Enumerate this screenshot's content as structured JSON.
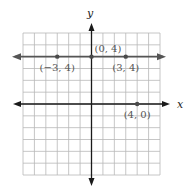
{
  "chart_data": {
    "type": "line",
    "title": "",
    "xlabel": "x",
    "ylabel": "y",
    "xlim": [
      -6,
      6
    ],
    "ylim": [
      -6,
      6
    ],
    "grid": true,
    "series": [
      {
        "name": "horizontal line y = 4",
        "x": [
          -6,
          6
        ],
        "y": [
          4,
          4
        ],
        "arrows": "both"
      }
    ],
    "points": [
      {
        "x": -3,
        "y": 4,
        "label": "(−3, 4)",
        "label_position": "below"
      },
      {
        "x": 0,
        "y": 4,
        "label": "(0, 4)",
        "label_position": "above-right"
      },
      {
        "x": 3,
        "y": 4,
        "label": "(3, 4)",
        "label_position": "below"
      },
      {
        "x": 4,
        "y": 0,
        "label": "(4, 0)",
        "label_position": "below"
      }
    ]
  }
}
